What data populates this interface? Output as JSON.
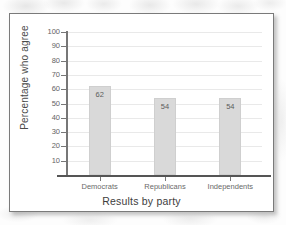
{
  "chart_data": {
    "type": "bar",
    "title": "",
    "categories": [
      "Democrats",
      "Republicans",
      "Independents"
    ],
    "values": [
      62,
      54,
      54
    ],
    "xlabel": "Results by party",
    "ylabel": "Percentage who agree",
    "ylim": [
      0,
      100
    ],
    "ytick_labels": [
      "100",
      "90",
      "80",
      "70",
      "60",
      "50",
      "40",
      "30",
      "20",
      "10"
    ],
    "ytick_values": [
      100,
      90,
      80,
      70,
      60,
      50,
      40,
      30,
      20,
      10
    ],
    "grid": true,
    "legend": "none",
    "bar_color": "#d9d9d9",
    "bar_border_color": "#cfcfcf",
    "gridline_color": "#e9e9e9",
    "axis_color": "#555555",
    "text_color": "#5c5c5c"
  }
}
